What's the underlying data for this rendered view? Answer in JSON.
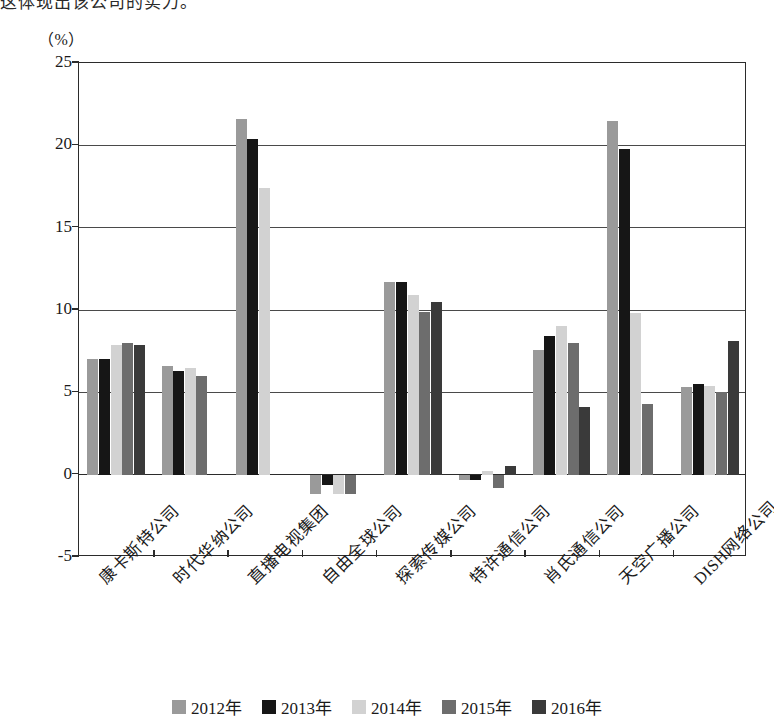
{
  "page": {
    "top_cut_text": "这体现出该公司的实力。",
    "unit_label": "（%）"
  },
  "chart_data": {
    "type": "bar",
    "title": "",
    "xlabel": "",
    "ylabel": "（%）",
    "ylim": [
      -5,
      25
    ],
    "yticks": [
      25,
      20,
      15,
      10,
      5,
      0,
      -5
    ],
    "ytick_labels": [
      "25",
      "20",
      "15",
      "10",
      "5",
      "0",
      "-5"
    ],
    "grid": true,
    "legend_position": "bottom",
    "categories": [
      "康卡斯特公司",
      "时代华纳公司",
      "直播电视集团",
      "自由全球公司",
      "探索传媒公司",
      "特许通信公司",
      "肖氏通信公司",
      "天空广播公司",
      "DISH网络公司"
    ],
    "series": [
      {
        "name": "2012年",
        "color": "#9a9a9a",
        "values": [
          7.0,
          6.6,
          21.6,
          -1.2,
          11.7,
          -0.3,
          7.6,
          21.5,
          5.3
        ]
      },
      {
        "name": "2013年",
        "color": "#161616",
        "values": [
          7.0,
          6.3,
          20.4,
          -0.6,
          11.7,
          -0.3,
          8.4,
          19.8,
          5.5
        ]
      },
      {
        "name": "2014年",
        "color": "#d2d2d2",
        "values": [
          7.9,
          6.5,
          17.4,
          -1.2,
          10.9,
          0.2,
          9.0,
          9.8,
          5.4
        ]
      },
      {
        "name": "2015年",
        "color": "#6d6d6d",
        "values": [
          8.0,
          6.0,
          null,
          -1.2,
          9.9,
          -0.8,
          8.0,
          4.3,
          5.0
        ]
      },
      {
        "name": "2016年",
        "color": "#3a3a3a",
        "values": [
          7.85,
          null,
          null,
          null,
          10.5,
          0.5,
          4.1,
          null,
          8.1
        ]
      }
    ]
  }
}
